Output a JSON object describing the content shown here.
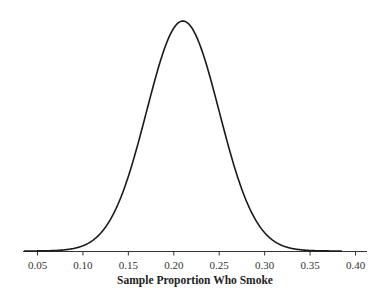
{
  "chart_data": {
    "type": "line",
    "title": "",
    "xlabel": "Sample Proportion Who Smoke",
    "ylabel": "",
    "xlim": [
      0.03,
      0.41
    ],
    "x_ticks": [
      0.05,
      0.1,
      0.15,
      0.2,
      0.25,
      0.3,
      0.35,
      0.4
    ],
    "x_tick_labels": [
      "0.05",
      "0.10",
      "0.15",
      "0.20",
      "0.25",
      "0.30",
      "0.35",
      "0.40"
    ],
    "grid": false,
    "legend": null,
    "series": [
      {
        "name": "Sampling distribution (normal curve)",
        "distribution": "normal",
        "mean": 0.21,
        "sd": 0.04,
        "color": "#1a1a1a"
      }
    ]
  },
  "axis": {
    "xlabel": "Sample Proportion Who Smoke",
    "ticks": [
      "0.05",
      "0.10",
      "0.15",
      "0.20",
      "0.25",
      "0.30",
      "0.35",
      "0.40"
    ]
  },
  "colors": {
    "curve": "#1a1a1a",
    "axis": "#333333"
  }
}
